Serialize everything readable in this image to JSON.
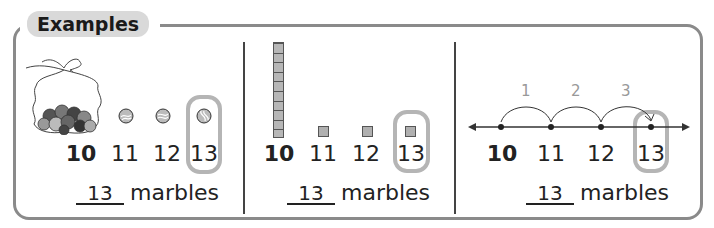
{
  "header": {
    "title": "Examples"
  },
  "panels": [
    {
      "id": "marbles",
      "numbers": [
        "10",
        "11",
        "12",
        "13"
      ],
      "highlighted": "13",
      "answer": {
        "value": "13",
        "unit": "marbles"
      }
    },
    {
      "id": "base-ten-blocks",
      "numbers": [
        "10",
        "11",
        "12",
        "13"
      ],
      "highlighted": "13",
      "answer": {
        "value": "13",
        "unit": "marbles"
      }
    },
    {
      "id": "number-line",
      "numbers": [
        "10",
        "11",
        "12",
        "13"
      ],
      "jumps": [
        "1",
        "2",
        "3"
      ],
      "highlighted": "13",
      "answer": {
        "value": "13",
        "unit": "marbles"
      }
    }
  ],
  "colors": {
    "frame": "#8a8a8a",
    "tab_bg": "#d9d9d9",
    "highlight": "#b5b5b5",
    "jump_label": "#999999"
  }
}
